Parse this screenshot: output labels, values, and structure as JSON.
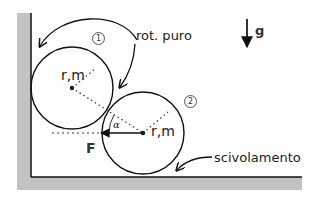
{
  "diagram": {
    "colors": {
      "wall_fill": "#c0c0c0",
      "line": "#111111",
      "background": "#ffffff"
    },
    "gravity": {
      "label": "g",
      "icon": "down-arrow-icon"
    },
    "disk1": {
      "label": "r,m",
      "badge": "1"
    },
    "disk2": {
      "label": "r,m",
      "badge": "2"
    },
    "force": {
      "label": "F"
    },
    "angle": {
      "label": "α"
    },
    "annotations": {
      "rolling": "rot. puro",
      "sliding": "scivolamento"
    }
  }
}
